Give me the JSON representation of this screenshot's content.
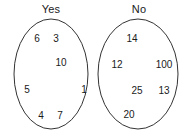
{
  "figure": {
    "type": "venn-two-disjoint-ellipses",
    "background_color": "#ffffff",
    "stroke_color": "#333333",
    "text_color": "#1a1a1a"
  },
  "sets": [
    {
      "id": "yes",
      "label": "Yes",
      "label_pos": {
        "x": 51,
        "y": 9
      },
      "ellipse": {
        "cx": 51,
        "cy": 74,
        "rx": 37,
        "ry": 55
      },
      "members": [
        {
          "value": "6",
          "x": 37,
          "y": 38
        },
        {
          "value": "3",
          "x": 56,
          "y": 38
        },
        {
          "value": "10",
          "x": 61,
          "y": 62
        },
        {
          "value": "5",
          "x": 27,
          "y": 89
        },
        {
          "value": "1",
          "x": 84,
          "y": 89
        },
        {
          "value": "4",
          "x": 41,
          "y": 115
        },
        {
          "value": "7",
          "x": 60,
          "y": 115
        }
      ]
    },
    {
      "id": "no",
      "label": "No",
      "label_pos": {
        "x": 139,
        "y": 9
      },
      "ellipse": {
        "cx": 138,
        "cy": 74,
        "rx": 40,
        "ry": 55
      },
      "members": [
        {
          "value": "14",
          "x": 132,
          "y": 38
        },
        {
          "value": "12",
          "x": 117,
          "y": 64
        },
        {
          "value": "100",
          "x": 164,
          "y": 64
        },
        {
          "value": "25",
          "x": 137,
          "y": 90
        },
        {
          "value": "13",
          "x": 164,
          "y": 90
        },
        {
          "value": "20",
          "x": 129,
          "y": 114
        }
      ]
    }
  ]
}
